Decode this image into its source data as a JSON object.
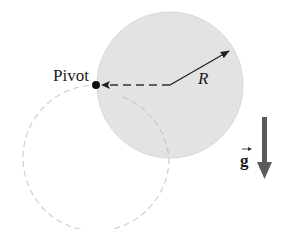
{
  "diagram": {
    "labels": {
      "pivot": "Pivot",
      "radius": "R",
      "gravity": "g"
    },
    "colors": {
      "disk_fill": "#e3e3e3",
      "disk_edge": "#d6d6d6",
      "dashed_circle": "#d0d0d0",
      "line": "#222222",
      "gravity_arrow": "#5a5a5a",
      "background": "#ffffff"
    },
    "geometry": {
      "disk_center": [
        170,
        85
      ],
      "disk_radius": 73,
      "pivot_point": [
        96,
        85
      ],
      "swing_circle_center": [
        96,
        158
      ],
      "swing_circle_radius": 73,
      "radius_arrow_end": [
        230,
        50
      ]
    }
  }
}
